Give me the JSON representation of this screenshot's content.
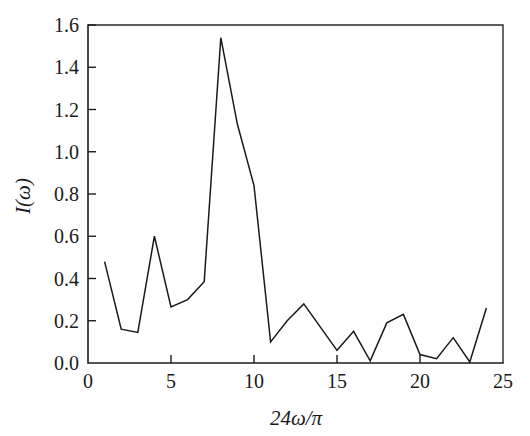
{
  "chart_data": {
    "type": "line",
    "title": "",
    "xlabel": "24ω/π",
    "ylabel": "I(ω)",
    "xlim": [
      0,
      25
    ],
    "ylim": [
      0.0,
      1.6
    ],
    "grid": false,
    "legend": null,
    "line_color": "#1a1a1a",
    "x": [
      1,
      2,
      3,
      4,
      5,
      6,
      7,
      8,
      9,
      10,
      11,
      12,
      13,
      14,
      15,
      16,
      17,
      18,
      19,
      20,
      21,
      22,
      23,
      24
    ],
    "values": [
      0.48,
      0.16,
      0.145,
      0.6,
      0.265,
      0.3,
      0.385,
      1.54,
      1.13,
      0.84,
      0.1,
      0.2,
      0.28,
      0.17,
      0.06,
      0.15,
      0.01,
      0.19,
      0.23,
      0.04,
      0.02,
      0.12,
      0.005,
      0.26
    ],
    "xticks": [
      0,
      5,
      10,
      15,
      20,
      25
    ],
    "xtick_labels": [
      "0",
      "5",
      "10",
      "15",
      "20",
      "25"
    ],
    "yticks": [
      0.0,
      0.2,
      0.4,
      0.6,
      0.8,
      1.0,
      1.2,
      1.4,
      1.6
    ],
    "ytick_labels": [
      "0.0",
      "0.2",
      "0.4",
      "0.6",
      "0.8",
      "1.0",
      "1.2",
      "1.4",
      "1.6"
    ],
    "xminor_step": 1,
    "series_name": "I(ω) spectrum"
  },
  "figure": {
    "background": "#ffffff",
    "axis_color": "#1a1a1a"
  }
}
